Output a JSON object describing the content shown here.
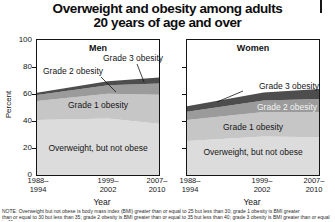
{
  "title": {
    "line1": "Overweight and obesity among adults",
    "line2": "20 years of age and over"
  },
  "chart_data": {
    "type": "area",
    "stacked": true,
    "title": "Overweight and obesity among adults 20 years of age and over",
    "categories": [
      "1988–1994",
      "1999–2002",
      "2007–2010"
    ],
    "x_tick_lines": [
      [
        "1988–",
        "1994"
      ],
      [
        "1999–",
        "2002"
      ],
      [
        "2007–",
        "2010"
      ]
    ],
    "xlabel": "Year",
    "ylabel": "Percent",
    "ylim": [
      0,
      100
    ],
    "y_ticks": [
      100,
      80,
      60,
      40,
      20,
      0
    ],
    "grid": false,
    "legend": "labels-inside-plot",
    "colors": [
      "#dcdcdc",
      "#c6c6c6",
      "#9b9b9b",
      "#4d4d4d"
    ],
    "panels": [
      {
        "name": "Men",
        "series": [
          {
            "name": "Overweight, but not obese",
            "values": [
              40.7,
              41.8,
              38.0
            ]
          },
          {
            "name": "Grade 1 obesity",
            "values": [
              14.1,
              18.4,
              21.4
            ]
          },
          {
            "name": "Grade 2 obesity",
            "values": [
              4.4,
              6.3,
              8.4
            ]
          },
          {
            "name": "Grade 3 obesity",
            "values": [
              1.7,
              3.0,
              4.4
            ]
          }
        ]
      },
      {
        "name": "Women",
        "series": [
          {
            "name": "Overweight, but not obese",
            "values": [
              25.2,
              28.6,
              27.9
            ]
          },
          {
            "name": "Grade 1 obesity",
            "values": [
              15.6,
              18.0,
              18.6
            ]
          },
          {
            "name": "Grade 2 obesity",
            "values": [
              6.1,
              8.6,
              9.8
            ]
          },
          {
            "name": "Grade 3 obesity",
            "values": [
              4.0,
              6.0,
              7.5
            ]
          }
        ]
      }
    ]
  },
  "note": {
    "line1": "NOTE: Overweight but not obese is body mass index (BMI) greater than or equal to 25 but less than 30; grade 1 obesity is BMI greater",
    "line2": "than or equal to 30 but less than 35; grade 2 obesity is BMI greater than or equal to 35 but less than 40; grade 3 obesity is BMI greater than or equal to 40."
  }
}
